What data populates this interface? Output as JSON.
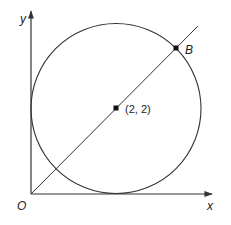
{
  "diagram": {
    "type": "coordinate-geometry",
    "colors": {
      "stroke": "#333333",
      "text": "#222222",
      "background": "#ffffff"
    },
    "axes": {
      "x_label": "x",
      "y_label": "y",
      "origin_label": "O"
    },
    "circle": {
      "center": [
        2,
        2
      ],
      "radius": 2,
      "tangent_to": [
        "x-axis",
        "y-axis"
      ]
    },
    "line": {
      "equation": "y = x",
      "passes_through": [
        "O",
        "(2, 2)",
        "B"
      ]
    },
    "points": [
      {
        "name": "center",
        "label": "(2, 2)",
        "coords": [
          2,
          2
        ]
      },
      {
        "name": "B",
        "label": "B"
      }
    ]
  }
}
